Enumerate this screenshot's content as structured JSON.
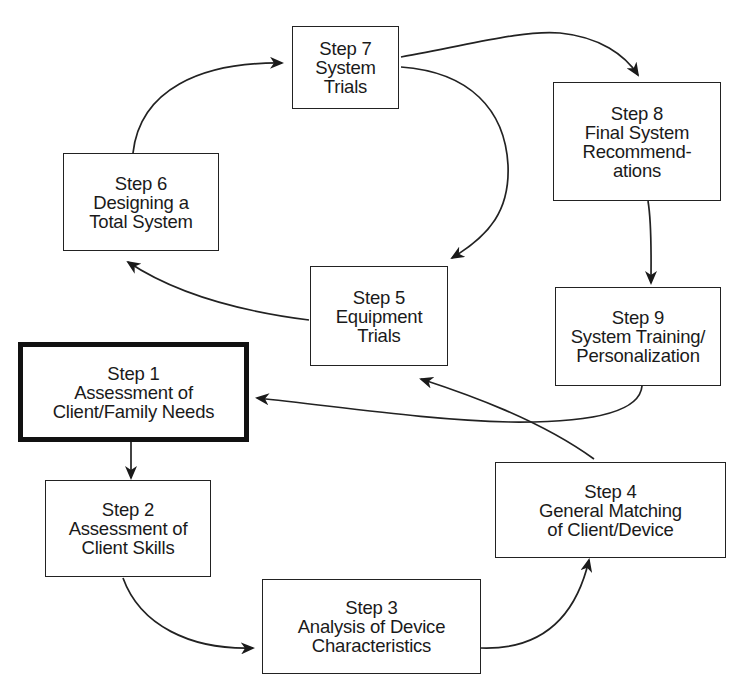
{
  "diagram": {
    "type": "cyclical process flow",
    "steps": [
      {
        "id": 1,
        "title": "Step 1",
        "lines": [
          "Assessment of",
          "Client/Family Needs"
        ],
        "emphasized": true
      },
      {
        "id": 2,
        "title": "Step 2",
        "lines": [
          "Assessment of",
          "Client Skills"
        ],
        "emphasized": false
      },
      {
        "id": 3,
        "title": "Step 3",
        "lines": [
          "Analysis of Device",
          "Characteristics"
        ],
        "emphasized": false
      },
      {
        "id": 4,
        "title": "Step 4",
        "lines": [
          "General Matching",
          "of Client/Device"
        ],
        "emphasized": false
      },
      {
        "id": 5,
        "title": "Step 5",
        "lines": [
          "Equipment",
          "Trials"
        ],
        "emphasized": false
      },
      {
        "id": 6,
        "title": "Step 6",
        "lines": [
          "Designing a",
          "Total System"
        ],
        "emphasized": false
      },
      {
        "id": 7,
        "title": "Step 7",
        "lines": [
          "System",
          "Trials"
        ],
        "emphasized": false
      },
      {
        "id": 8,
        "title": "Step 8",
        "lines": [
          "Final System",
          "Recommend-",
          "ations"
        ],
        "emphasized": false
      },
      {
        "id": 9,
        "title": "Step 9",
        "lines": [
          "System Training/",
          "Personalization"
        ],
        "emphasized": false
      }
    ],
    "connections": [
      {
        "from": 1,
        "to": 2
      },
      {
        "from": 2,
        "to": 3
      },
      {
        "from": 3,
        "to": 4
      },
      {
        "from": 4,
        "to": 5
      },
      {
        "from": 5,
        "to": 6
      },
      {
        "from": 6,
        "to": 7
      },
      {
        "from": 7,
        "to": 5
      },
      {
        "from": 7,
        "to": 8
      },
      {
        "from": 8,
        "to": 9
      },
      {
        "from": 9,
        "to": 1
      }
    ],
    "colors": {
      "line": "#222222",
      "background": "#ffffff",
      "text": "#1a1a1a"
    }
  }
}
